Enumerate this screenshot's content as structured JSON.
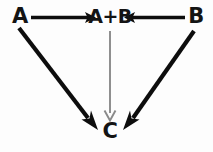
{
  "diagram": {
    "type": "flow-diagram",
    "style": "hand-drawn",
    "background_color": "#fdfdfd",
    "width": 213,
    "height": 152,
    "nodes": [
      {
        "id": "A",
        "label": "A",
        "x": 20,
        "y": 17
      },
      {
        "id": "AB",
        "label": "A+B",
        "x": 110,
        "y": 17
      },
      {
        "id": "B",
        "label": "B",
        "x": 196,
        "y": 17
      },
      {
        "id": "C",
        "label": "C",
        "x": 110,
        "y": 133
      }
    ],
    "edges": [
      {
        "id": "a-to-ab",
        "from": "A",
        "to": "AB",
        "direction": "right",
        "weight": "thick",
        "color": "#0d0d0d",
        "arrowhead": "solid"
      },
      {
        "id": "b-to-ab",
        "from": "B",
        "to": "AB",
        "direction": "left",
        "weight": "thick",
        "color": "#0d0d0d",
        "arrowhead": "solid"
      },
      {
        "id": "a-to-c",
        "from": "A",
        "to": "C",
        "direction": "down-right",
        "weight": "thick",
        "color": "#0d0d0d",
        "arrowhead": "solid"
      },
      {
        "id": "b-to-c",
        "from": "B",
        "to": "C",
        "direction": "down-left",
        "weight": "thick",
        "color": "#0d0d0d",
        "arrowhead": "solid"
      },
      {
        "id": "ab-to-c",
        "from": "AB",
        "to": "C",
        "direction": "down",
        "weight": "thin",
        "color": "#8a8a8a",
        "arrowhead": "open"
      }
    ]
  }
}
